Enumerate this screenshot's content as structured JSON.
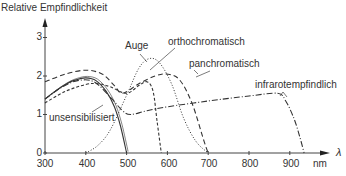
{
  "chart_data": {
    "type": "line",
    "title": "",
    "ylabel": "Relative Empfindlichkeit",
    "xlabel": "λ",
    "x_unit": "nm",
    "xlim": [
      300,
      950
    ],
    "ylim": [
      0,
      3.2
    ],
    "x_ticks": [
      300,
      400,
      500,
      600,
      700,
      800,
      900
    ],
    "y_ticks": [
      0,
      1,
      2,
      3
    ],
    "grid": false,
    "legend": "inline labels with leader lines",
    "series": [
      {
        "name": "unsensibilisiert",
        "style": "solid",
        "x": [
          300,
          325,
          350,
          375,
          400,
          425,
          450,
          470,
          485,
          500
        ],
        "values": [
          1.4,
          1.6,
          1.78,
          1.9,
          1.95,
          1.88,
          1.6,
          1.2,
          0.7,
          0.0
        ]
      },
      {
        "name": "orthochromatisch",
        "style": "short-dash",
        "x": [
          300,
          350,
          400,
          430,
          460,
          500,
          530,
          550,
          565,
          575,
          585
        ],
        "values": [
          1.3,
          1.6,
          1.78,
          1.8,
          1.72,
          1.55,
          1.75,
          1.85,
          1.6,
          0.8,
          0.0
        ]
      },
      {
        "name": "Auge",
        "style": "dotted",
        "x": [
          400,
          430,
          460,
          500,
          530,
          555,
          580,
          610,
          640,
          670,
          700
        ],
        "values": [
          0.0,
          0.2,
          0.6,
          1.5,
          2.2,
          2.45,
          2.35,
          1.8,
          0.9,
          0.3,
          0.0
        ]
      },
      {
        "name": "panchromatisch",
        "style": "long-dash",
        "x": [
          300,
          350,
          400,
          440,
          470,
          490,
          530,
          570,
          600,
          630,
          660,
          690,
          700
        ],
        "values": [
          1.85,
          2.05,
          2.15,
          2.05,
          1.75,
          1.55,
          1.8,
          2.0,
          2.05,
          1.9,
          1.3,
          0.3,
          0.0
        ]
      },
      {
        "name": "infrarotempfindlich",
        "style": "dash-dot",
        "x": [
          300,
          340,
          380,
          420,
          460,
          490,
          510,
          550,
          600,
          700,
          800,
          870,
          890,
          910,
          925,
          935
        ],
        "values": [
          1.4,
          1.7,
          1.88,
          1.85,
          1.45,
          1.1,
          1.0,
          1.1,
          1.2,
          1.35,
          1.48,
          1.55,
          1.35,
          0.9,
          0.4,
          0.0
        ]
      }
    ]
  },
  "labels": {
    "ylabel": "Relative Empfindlichkeit",
    "x_unit": "nm",
    "x_symbol": "λ",
    "y_ticks": [
      "0",
      "1",
      "2",
      "3"
    ],
    "x_ticks": [
      "300",
      "400",
      "500",
      "600",
      "700",
      "800",
      "900"
    ],
    "curve_labels": {
      "auge": "Auge",
      "ortho": "orthochromatisch",
      "pan": "panchromatisch",
      "infra": "infrarotempfindlich",
      "unsens": "unsensibilisiert"
    }
  },
  "colors": {
    "ink": "#333333",
    "axis": "#444444",
    "background": "#ffffff"
  }
}
